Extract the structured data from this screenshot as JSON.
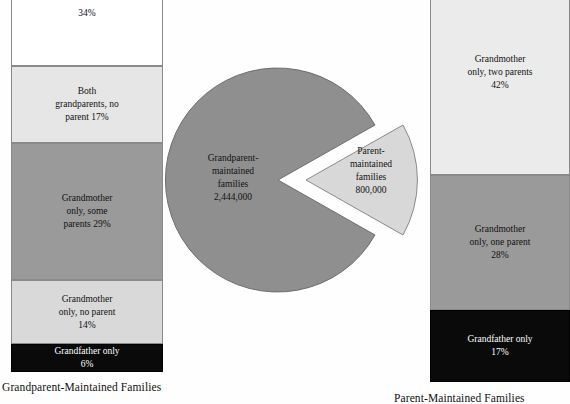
{
  "chart_data": {
    "type": "pie",
    "title": "",
    "labels": [
      "Grandparent-maintained families",
      "Parent-maintained families"
    ],
    "values": [
      2444000,
      800000
    ],
    "value_labels": [
      "2,444,000",
      "800,000"
    ],
    "legend": "none",
    "exploded_slice": "Parent-maintained families",
    "colors": [
      "#8f8f8f",
      "#d8d8d8"
    ],
    "components": [
      {
        "type": "bar",
        "orientation": "stacked-vertical",
        "name": "grandparent-maintained-families-breakdown",
        "caption": "Grandparent-Maintained Families",
        "ylabel": "",
        "xlabel": "",
        "categories": [
          "Grandmother only, both parents",
          "Both grandparents, no parent",
          "Grandmother only, some parents",
          "Grandmother only, no parent",
          "Grandfather only"
        ],
        "values": [
          34,
          17,
          29,
          14,
          6
        ],
        "value_labels": [
          "34%",
          "17%",
          "29%",
          "14%",
          "6%"
        ],
        "colors": [
          "#ffffff",
          "#e6e6e6",
          "#9a9a9a",
          "#d9d9d9",
          "#0a0a0a"
        ]
      },
      {
        "type": "bar",
        "orientation": "stacked-vertical",
        "name": "parent-maintained-families-breakdown",
        "caption": "Parent-Maintained Families",
        "ylabel": "",
        "xlabel": "",
        "categories": [
          "Grandmother only, two parents",
          "Grandmother only, one parent",
          "Grandfather only"
        ],
        "values": [
          42,
          28,
          17
        ],
        "value_labels": [
          "42%",
          "28%",
          "17%"
        ],
        "colors": [
          "#ebebeb",
          "#9a9a9a",
          "#0a0a0a"
        ]
      }
    ]
  },
  "left_bar": {
    "caption": "Grandparent-Maintained Families",
    "segments": [
      {
        "text": "34%",
        "percent": "34%"
      },
      {
        "text": "Both\ngrandparents, no\nparent  17%",
        "percent": "17%"
      },
      {
        "text": "Grandmother\nonly, some\nparents  29%",
        "percent": "29%"
      },
      {
        "text": "Grandmother\nonly, no parent\n14%",
        "percent": "14%"
      },
      {
        "text": "Grandfather only\n6%",
        "percent": "6%"
      }
    ]
  },
  "right_bar": {
    "caption": "Parent-Maintained Families",
    "segments": [
      {
        "text": "Grandmother\nonly, two parents\n42%",
        "percent": "42%"
      },
      {
        "text": "Grandmother\nonly, one parent\n28%",
        "percent": "28%"
      },
      {
        "text": "Grandfather only\n17%",
        "percent": "17%"
      }
    ]
  },
  "pie": {
    "slices": [
      {
        "label": "Grandparent-\nmaintained\nfamilies\n2,444,000",
        "value": "2,444,000"
      },
      {
        "label": "Parent-\nmaintained\nfamilies\n800,000",
        "value": "800,000"
      }
    ]
  }
}
